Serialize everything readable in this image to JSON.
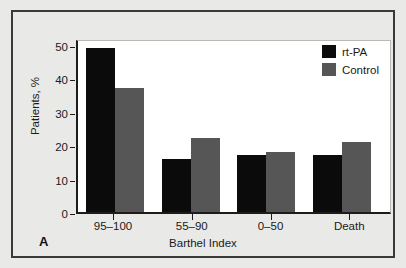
{
  "figure": {
    "panel_label": "A",
    "background_color": "#e9e9e7",
    "frame_color": "#3a3a3a",
    "plot_background": "#ffffff"
  },
  "legend": {
    "position": "top-right",
    "entries": [
      {
        "label": "rt-PA",
        "color": "#0b0b0b"
      },
      {
        "label": "Control",
        "color": "#565656"
      }
    ]
  },
  "chart_data": {
    "type": "bar",
    "title": "",
    "subtitle": "",
    "xlabel": "Barthel Index",
    "ylabel": "Patients, %",
    "categories": [
      "95–100",
      "55–90",
      "0–50",
      "Death"
    ],
    "series": [
      {
        "name": "rt-PA",
        "color": "#0b0b0b",
        "values": [
          49.5,
          15.9,
          17.2,
          17.3
        ]
      },
      {
        "name": "Control",
        "color": "#565656",
        "values": [
          37.5,
          22.3,
          18.0,
          21.3
        ]
      }
    ],
    "ylim": [
      0,
      52
    ],
    "yticks": [
      0,
      10,
      20,
      30,
      40,
      50
    ],
    "ytick_labels": [
      "0",
      "10",
      "20",
      "30",
      "40",
      "50"
    ],
    "grid": false,
    "legend_position": "top-right"
  }
}
